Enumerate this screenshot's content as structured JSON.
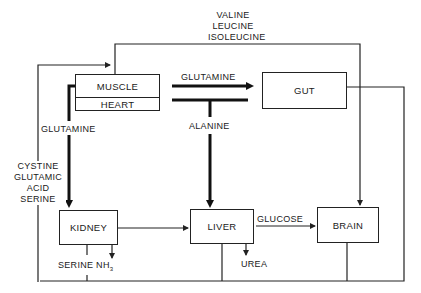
{
  "organs": {
    "muscle": "MUSCLE",
    "heart": "HEART",
    "gut": "GUT",
    "kidney": "KIDNEY",
    "liver": "LIVER",
    "brain": "BRAIN"
  },
  "flows": {
    "bcaa": [
      "VALINE",
      "LEUCINE",
      "ISOLEUCINE"
    ],
    "glutamine_to_gut": "GLUTAMINE",
    "alanine": "ALANINE",
    "glutamine_to_kidney": "GLUTAMINE",
    "cystine_group": [
      "CYSTINE",
      "GLUTAMIC",
      "ACID",
      "SERINE"
    ],
    "glucose": "GLUCOSE",
    "urea": "UREA",
    "serine_nh3": "SERINE NH",
    "nh3_subscript": "3"
  },
  "colors": {
    "line": "#222222",
    "background": "#ffffff"
  }
}
